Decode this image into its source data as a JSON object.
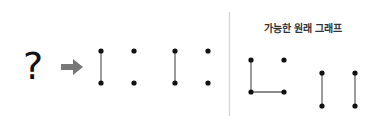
{
  "left": {
    "question_mark": "?",
    "arrow": "right-arrow",
    "result_graphs": [
      {
        "nodes": [
          [
            101,
            51
          ],
          [
            101,
            83
          ],
          [
            134,
            51
          ],
          [
            134,
            83
          ]
        ],
        "edges": [
          [
            0,
            1
          ]
        ]
      },
      {
        "nodes": [
          [
            175,
            51
          ],
          [
            175,
            83
          ],
          [
            208,
            51
          ],
          [
            208,
            83
          ]
        ],
        "edges": [
          [
            0,
            1
          ]
        ]
      }
    ]
  },
  "right": {
    "title": "가능한 원래 그래프",
    "possible_graphs": [
      {
        "nodes": [
          [
            251,
            60
          ],
          [
            284,
            60
          ],
          [
            251,
            92
          ],
          [
            284,
            92
          ]
        ],
        "edges": [
          [
            0,
            2
          ],
          [
            2,
            3
          ]
        ]
      },
      {
        "nodes": [
          [
            322,
            73
          ],
          [
            322,
            106
          ],
          [
            355,
            73
          ],
          [
            355,
            106
          ]
        ],
        "edges": [
          [
            0,
            1
          ],
          [
            2,
            3
          ]
        ]
      }
    ]
  },
  "colors": {
    "node": "#111111",
    "edge": "#666666",
    "arrow": "#777777",
    "divider": "#d8d8d8"
  }
}
